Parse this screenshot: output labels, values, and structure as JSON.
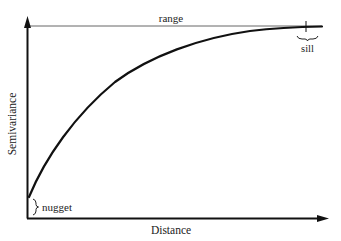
{
  "diagram": {
    "type": "semivariogram",
    "axes": {
      "x_label": "Distance",
      "y_label": "Semivariance"
    },
    "annotations": {
      "range": "range",
      "sill": "sill",
      "nugget": "nugget"
    },
    "colors": {
      "ink": "#111111",
      "thin_line": "#555555",
      "text": "#222222",
      "background": "#ffffff"
    }
  }
}
